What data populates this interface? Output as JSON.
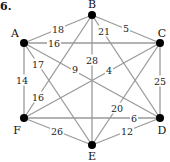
{
  "problem_number": "6.",
  "graph": {
    "nodes": [
      {
        "id": "A",
        "x": 24,
        "y": 43,
        "lx": 15,
        "ly": 33
      },
      {
        "id": "B",
        "x": 92,
        "y": 15,
        "lx": 92,
        "ly": 4
      },
      {
        "id": "C",
        "x": 160,
        "y": 43,
        "lx": 162,
        "ly": 33
      },
      {
        "id": "D",
        "x": 160,
        "y": 118,
        "lx": 162,
        "ly": 130
      },
      {
        "id": "E",
        "x": 92,
        "y": 145,
        "lx": 92,
        "ly": 156
      },
      {
        "id": "F",
        "x": 24,
        "y": 118,
        "lx": 17,
        "ly": 130
      }
    ],
    "edges": [
      {
        "from": "A",
        "to": "B",
        "weight": "18",
        "lx": 58,
        "ly": 29
      },
      {
        "from": "A",
        "to": "C",
        "weight": "16",
        "lx": 54,
        "ly": 43
      },
      {
        "from": "A",
        "to": "D",
        "weight": "9",
        "lx": 75,
        "ly": 69
      },
      {
        "from": "A",
        "to": "E",
        "weight": "17",
        "lx": 38,
        "ly": 64
      },
      {
        "from": "A",
        "to": "F",
        "weight": "14",
        "lx": 22,
        "ly": 80
      },
      {
        "from": "B",
        "to": "C",
        "weight": "5",
        "lx": 126,
        "ly": 28
      },
      {
        "from": "B",
        "to": "D",
        "weight": "21",
        "lx": 104,
        "ly": 31
      },
      {
        "from": "B",
        "to": "E",
        "weight": "28",
        "lx": 92,
        "ly": 60
      },
      {
        "from": "B",
        "to": "F",
        "weight": "16",
        "lx": 38,
        "ly": 97
      },
      {
        "from": "C",
        "to": "F",
        "weight": "4",
        "lx": 109,
        "ly": 70
      },
      {
        "from": "C",
        "to": "E",
        "weight": "20",
        "lx": 117,
        "ly": 108
      },
      {
        "from": "C",
        "to": "D",
        "weight": "25",
        "lx": 160,
        "ly": 81
      },
      {
        "from": "F",
        "to": "D",
        "weight": "6",
        "lx": 134,
        "ly": 118
      },
      {
        "from": "D",
        "to": "E",
        "weight": "12",
        "lx": 127,
        "ly": 131
      },
      {
        "from": "F",
        "to": "E",
        "weight": "26",
        "lx": 57,
        "ly": 131
      }
    ]
  }
}
